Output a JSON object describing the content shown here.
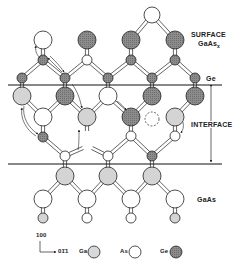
{
  "labels": {
    "surface": "SURFACE",
    "surface_formula": "GaAs",
    "surface_formula_sub": "x",
    "ge_layer": "Ge",
    "interface": "INTERFACE",
    "substrate": "GaAs"
  },
  "axes": {
    "vertical": "100",
    "horizontal": "01̄1"
  },
  "legend": [
    {
      "label": "Ga",
      "species": "Ga",
      "fill": "#d8d8d8"
    },
    {
      "label": "As",
      "species": "As",
      "fill": "#ffffff"
    },
    {
      "label": "Ge",
      "species": "Ge",
      "fill": "#8a8a8a"
    }
  ],
  "colors": {
    "Ga": "#d4d4d4",
    "As": "#ffffff",
    "Ge": "#8c8c8c",
    "stroke": "#222222"
  },
  "boundary_lines_y": [
    85,
    164
  ],
  "atoms": [
    {
      "x": 152,
      "y": 15,
      "r": 8,
      "s": "As"
    },
    {
      "x": 43,
      "y": 40,
      "r": 9,
      "s": "As"
    },
    {
      "x": 87,
      "y": 40,
      "r": 9,
      "s": "Ge"
    },
    {
      "x": 131,
      "y": 40,
      "r": 9,
      "s": "Ge"
    },
    {
      "x": 175,
      "y": 40,
      "r": 9,
      "s": "Ge"
    },
    {
      "x": 43,
      "y": 60,
      "r": 5,
      "s": "Ge"
    },
    {
      "x": 87,
      "y": 60,
      "r": 5,
      "s": "As"
    },
    {
      "x": 131,
      "y": 60,
      "r": 5,
      "s": "Ge"
    },
    {
      "x": 175,
      "y": 60,
      "r": 5,
      "s": "Ge"
    },
    {
      "x": 22,
      "y": 78,
      "r": 5,
      "s": "Ge"
    },
    {
      "x": 65,
      "y": 78,
      "r": 5,
      "s": "Ge"
    },
    {
      "x": 108,
      "y": 78,
      "r": 5,
      "s": "Ge"
    },
    {
      "x": 152,
      "y": 78,
      "r": 5,
      "s": "Ge"
    },
    {
      "x": 195,
      "y": 78,
      "r": 5,
      "s": "Ge"
    },
    {
      "x": 22,
      "y": 96,
      "r": 9,
      "s": "Ga"
    },
    {
      "x": 65,
      "y": 96,
      "r": 9,
      "s": "Ge"
    },
    {
      "x": 108,
      "y": 96,
      "r": 9,
      "s": "As"
    },
    {
      "x": 152,
      "y": 96,
      "r": 9,
      "s": "Ge"
    },
    {
      "x": 195,
      "y": 96,
      "r": 9,
      "s": "Ge"
    },
    {
      "x": 43,
      "y": 117,
      "r": 9,
      "s": "As"
    },
    {
      "x": 87,
      "y": 117,
      "r": 9,
      "s": "Ga"
    },
    {
      "x": 131,
      "y": 117,
      "r": 9,
      "s": "Ge"
    },
    {
      "x": 175,
      "y": 117,
      "r": 9,
      "s": "Ga"
    },
    {
      "x": 43,
      "y": 137,
      "r": 5,
      "s": "Ge"
    },
    {
      "x": 131,
      "y": 136,
      "r": 5,
      "s": "As"
    },
    {
      "x": 175,
      "y": 136,
      "r": 5,
      "s": "As"
    },
    {
      "x": 65,
      "y": 156,
      "r": 5,
      "s": "As"
    },
    {
      "x": 108,
      "y": 156,
      "r": 5,
      "s": "As"
    },
    {
      "x": 152,
      "y": 156,
      "r": 5,
      "s": "Ge"
    },
    {
      "x": 65,
      "y": 176,
      "r": 9,
      "s": "Ga"
    },
    {
      "x": 108,
      "y": 176,
      "r": 9,
      "s": "Ga"
    },
    {
      "x": 152,
      "y": 176,
      "r": 9,
      "s": "Ga"
    },
    {
      "x": 43,
      "y": 199,
      "r": 9,
      "s": "As"
    },
    {
      "x": 87,
      "y": 199,
      "r": 9,
      "s": "As"
    },
    {
      "x": 131,
      "y": 199,
      "r": 9,
      "s": "As"
    },
    {
      "x": 175,
      "y": 199,
      "r": 9,
      "s": "As"
    },
    {
      "x": 43,
      "y": 218,
      "r": 5,
      "s": "Ga"
    },
    {
      "x": 87,
      "y": 218,
      "r": 5,
      "s": "As"
    },
    {
      "x": 131,
      "y": 218,
      "r": 5,
      "s": "As"
    },
    {
      "x": 175,
      "y": 218,
      "r": 5,
      "s": "Ga"
    }
  ],
  "vacancy": {
    "x": 152,
    "y": 119,
    "r": 7
  },
  "bonds": [
    [
      152,
      15,
      131,
      40
    ],
    [
      152,
      15,
      175,
      40
    ],
    [
      43,
      40,
      43,
      60
    ],
    [
      87,
      40,
      87,
      60
    ],
    [
      131,
      40,
      131,
      60
    ],
    [
      175,
      40,
      175,
      60
    ],
    [
      43,
      60,
      22,
      78
    ],
    [
      43,
      60,
      65,
      78
    ],
    [
      87,
      60,
      65,
      78
    ],
    [
      87,
      60,
      108,
      78
    ],
    [
      131,
      60,
      108,
      78
    ],
    [
      131,
      60,
      152,
      78
    ],
    [
      175,
      60,
      152,
      78
    ],
    [
      175,
      60,
      195,
      78
    ],
    [
      22,
      78,
      22,
      96
    ],
    [
      65,
      78,
      65,
      96
    ],
    [
      108,
      78,
      108,
      96
    ],
    [
      152,
      78,
      152,
      96
    ],
    [
      195,
      78,
      195,
      96
    ],
    [
      22,
      96,
      43,
      117
    ],
    [
      65,
      96,
      43,
      117
    ],
    [
      65,
      96,
      87,
      117
    ],
    [
      108,
      96,
      87,
      117
    ],
    [
      108,
      96,
      131,
      117
    ],
    [
      152,
      96,
      131,
      117
    ],
    [
      195,
      96,
      175,
      117
    ],
    [
      43,
      117,
      43,
      137
    ],
    [
      87,
      117,
      87,
      131
    ],
    [
      131,
      117,
      131,
      136
    ],
    [
      175,
      117,
      175,
      136
    ],
    [
      43,
      137,
      65,
      156
    ],
    [
      83,
      148,
      65,
      156
    ],
    [
      92,
      148,
      108,
      156
    ],
    [
      131,
      136,
      108,
      156
    ],
    [
      131,
      136,
      152,
      156
    ],
    [
      175,
      136,
      152,
      156
    ],
    [
      65,
      156,
      65,
      176
    ],
    [
      108,
      156,
      108,
      176
    ],
    [
      152,
      156,
      152,
      176
    ],
    [
      65,
      176,
      43,
      199
    ],
    [
      65,
      176,
      87,
      199
    ],
    [
      108,
      176,
      87,
      199
    ],
    [
      108,
      176,
      131,
      199
    ],
    [
      152,
      176,
      131,
      199
    ],
    [
      152,
      176,
      175,
      199
    ],
    [
      43,
      199,
      43,
      218
    ],
    [
      87,
      199,
      87,
      218
    ],
    [
      131,
      199,
      131,
      218
    ],
    [
      175,
      199,
      175,
      218
    ]
  ]
}
